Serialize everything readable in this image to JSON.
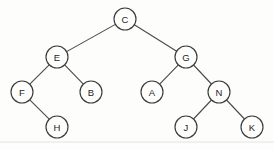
{
  "figure": {
    "type": "binary-tree",
    "background_color": "#fdfdfc",
    "node_stroke_color": "#3b3b3b",
    "edge_stroke_color": "#4a4a4a",
    "label_color": "#1e1e1e",
    "node_radius": 11
  },
  "nodes": [
    {
      "id": "C",
      "label": "C",
      "cx": 125,
      "cy": 19,
      "depth": 0
    },
    {
      "id": "E",
      "label": "E",
      "cx": 57,
      "cy": 57,
      "depth": 1
    },
    {
      "id": "G",
      "label": "G",
      "cx": 186,
      "cy": 57,
      "depth": 1
    },
    {
      "id": "F",
      "label": "F",
      "cx": 22,
      "cy": 92,
      "depth": 2
    },
    {
      "id": "B",
      "label": "B",
      "cx": 91,
      "cy": 92,
      "depth": 2
    },
    {
      "id": "A",
      "label": "A",
      "cx": 152,
      "cy": 92,
      "depth": 2
    },
    {
      "id": "N",
      "label": "N",
      "cx": 219,
      "cy": 92,
      "depth": 2
    },
    {
      "id": "H",
      "label": "H",
      "cx": 57,
      "cy": 127,
      "depth": 3
    },
    {
      "id": "J",
      "label": "J",
      "cx": 186,
      "cy": 127,
      "depth": 3
    },
    {
      "id": "K",
      "label": "K",
      "cx": 252,
      "cy": 127,
      "depth": 3
    }
  ],
  "edges": [
    {
      "from": "C",
      "to": "E",
      "side": "left"
    },
    {
      "from": "C",
      "to": "G",
      "side": "right"
    },
    {
      "from": "E",
      "to": "F",
      "side": "left"
    },
    {
      "from": "E",
      "to": "B",
      "side": "right"
    },
    {
      "from": "F",
      "to": "H",
      "side": "right"
    },
    {
      "from": "G",
      "to": "A",
      "side": "left"
    },
    {
      "from": "G",
      "to": "N",
      "side": "right"
    },
    {
      "from": "N",
      "to": "J",
      "side": "left"
    },
    {
      "from": "N",
      "to": "K",
      "side": "right"
    }
  ],
  "baseline_rule": {
    "y": 142,
    "x1": 0,
    "x2": 274,
    "color": "#e3e3e1"
  }
}
